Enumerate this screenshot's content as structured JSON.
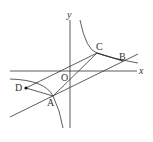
{
  "figure": {
    "axes": {
      "x_label": "x",
      "y_label": "y",
      "origin_label": "O"
    },
    "points": {
      "A": "A",
      "B": "B",
      "C": "C",
      "D": "D"
    },
    "stroke_color": "#333333"
  }
}
